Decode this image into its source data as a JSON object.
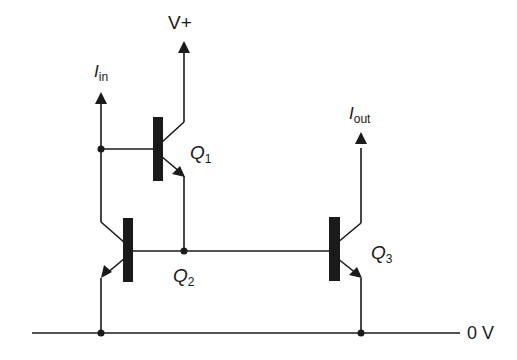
{
  "diagram": {
    "type": "circuit",
    "colors": {
      "line": "#1a1a1a",
      "background": "#ffffff"
    },
    "labels": {
      "supply": "V+",
      "ground": "0 V",
      "input_current": {
        "main": "I",
        "sub": "in"
      },
      "output_current": {
        "main": "I",
        "sub": "out"
      }
    },
    "transistors": [
      {
        "id": "Q1",
        "main": "Q",
        "sub": "1",
        "kind": "npn"
      },
      {
        "id": "Q2",
        "main": "Q",
        "sub": "2",
        "kind": "npn"
      },
      {
        "id": "Q3",
        "main": "Q",
        "sub": "3",
        "kind": "npn"
      }
    ],
    "connections": [
      "I_in node connects to Q1 base and Q2 collector",
      "Q1 collector to V+",
      "Q1 emitter to Q2 base and Q3 base",
      "Q2 emitter to 0 V",
      "Q3 collector to I_out",
      "Q3 emitter to 0 V"
    ]
  }
}
